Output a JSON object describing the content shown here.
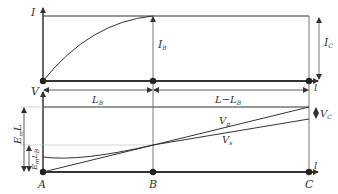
{
  "top_panel": {
    "axis_label": "I",
    "current_B_label": "I",
    "current_B_sub": "B",
    "current_C_label": "I",
    "current_C_sub": "C",
    "end_label": "l"
  },
  "dimensions": {
    "left_axis_label": "V",
    "segment_1_label": "L",
    "segment_1_sub": "B",
    "segment_2_label": "L−L",
    "segment_2_sub": "B"
  },
  "bottom_panel": {
    "emL_label": "E",
    "emL_sub": "m",
    "emL_suffix": "L",
    "emLB_label": "E",
    "emLB_sub": "m",
    "emLB_suffix": "L",
    "emLB_suffix_sub": "B",
    "vp_label": "V",
    "vp_sub": "p",
    "vs_label": "V",
    "vs_sub": "s",
    "vc_label": "V",
    "vc_sub": "C",
    "end_label": "l",
    "points": [
      "A",
      "B",
      "C"
    ]
  },
  "colors": {
    "line": "#333333",
    "thin_line": "#555555",
    "guide": "#bbbbbb"
  }
}
